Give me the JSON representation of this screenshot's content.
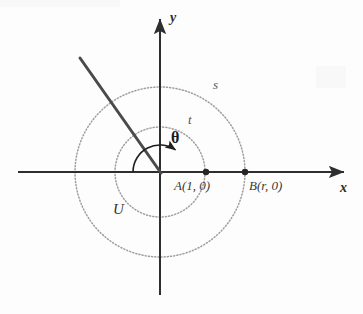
{
  "figure": {
    "axes": {
      "x_label": "x",
      "y_label": "y",
      "origin": [
        160,
        172
      ],
      "x_range_px": [
        18,
        348
      ],
      "y_range_px": [
        295,
        14
      ]
    },
    "circles": [
      {
        "name": "s",
        "label": "s",
        "label_pos": [
          213,
          84
        ],
        "center": [
          160,
          172
        ],
        "radius": 85,
        "style": "dotted",
        "color": "#9a9a9a"
      },
      {
        "name": "t",
        "label": "t",
        "label_pos": [
          188,
          119
        ],
        "center": [
          160,
          172
        ],
        "radius": 45,
        "style": "dotted",
        "color": "#9a9a9a"
      }
    ],
    "region": {
      "label": "U",
      "label_pos": [
        113,
        209
      ]
    },
    "points": [
      {
        "name": "A",
        "label": "A(1, 0)",
        "coords": [
          206,
          172
        ],
        "dot_radius": 3.2
      },
      {
        "name": "B",
        "label": "B(r, 0)",
        "coords": [
          245,
          172
        ],
        "dot_radius": 3.2
      }
    ],
    "angle": {
      "symbol": "θ",
      "label_pos": [
        171,
        136
      ],
      "arc_radius": 27,
      "from_deg": 0,
      "to_deg": 125,
      "arrow_at": "ray-end"
    },
    "ray": {
      "name": "terminal-ray",
      "from": [
        160,
        172
      ],
      "to": [
        80,
        58
      ],
      "color": "#4a4a4a",
      "width": 3
    }
  }
}
